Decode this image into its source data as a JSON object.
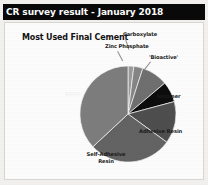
{
  "header": {
    "title": "CR survey result - January 2018"
  },
  "chart_data": {
    "type": "pie",
    "title": "Most Used Final Cement",
    "xlabel": "",
    "ylabel": "",
    "legend_position": "none",
    "grid": false,
    "labels_placement": "outside-with-leader-lines",
    "categories": [
      "Carboxylate",
      "Zinc Phosphate",
      "'Bioactive'",
      "Ionomer",
      "Adhesive Resin",
      "Self-Adhesive Resin",
      "RMGI"
    ],
    "values": [
      2,
      3,
      9,
      7,
      14,
      28,
      37
    ],
    "units": "percent",
    "slices": [
      {
        "label": "Carboxylate",
        "value": 2,
        "color": "#9a9a9a",
        "start_angle": 0,
        "end_angle": 7
      },
      {
        "label": "Zinc Phosphate",
        "value": 3,
        "color": "#858585",
        "start_angle": 7,
        "end_angle": 18
      },
      {
        "label": "'Bioactive'",
        "value": 9,
        "color": "#6f6f6f",
        "start_angle": 18,
        "end_angle": 50
      },
      {
        "label": "Ionomer",
        "value": 7,
        "color": "#0d0d0d",
        "start_angle": 50,
        "end_angle": 75
      },
      {
        "label": "Adhesive Resin",
        "value": 14,
        "color": "#4e4e4e",
        "start_angle": 75,
        "end_angle": 126
      },
      {
        "label": "Self-Adhesive Resin",
        "value": 28,
        "color": "#636363",
        "start_angle": 126,
        "end_angle": 227
      },
      {
        "label": "RMGI",
        "value": 37,
        "color": "#7d7d7d",
        "start_angle": 227,
        "end_angle": 360
      }
    ]
  },
  "labels": {
    "carboxylate": "Carboxylate",
    "zinc_phosphate": "Zinc Phosphate",
    "bioactive": "'Bioactive'",
    "ionomer": "Ionomer",
    "adhesive_resin": "Adhesive Resin",
    "self_adhesive_resin_line1": "Self-Adhesive",
    "self_adhesive_resin_line2": "Resin",
    "rmgi": "RMGI"
  },
  "colors": {
    "header_bar": "#090909",
    "header_text": "#fdfdfd",
    "slide_background": "#fcfcfc",
    "page_background": "#f2f1ef",
    "text": "#1a1a1a"
  }
}
